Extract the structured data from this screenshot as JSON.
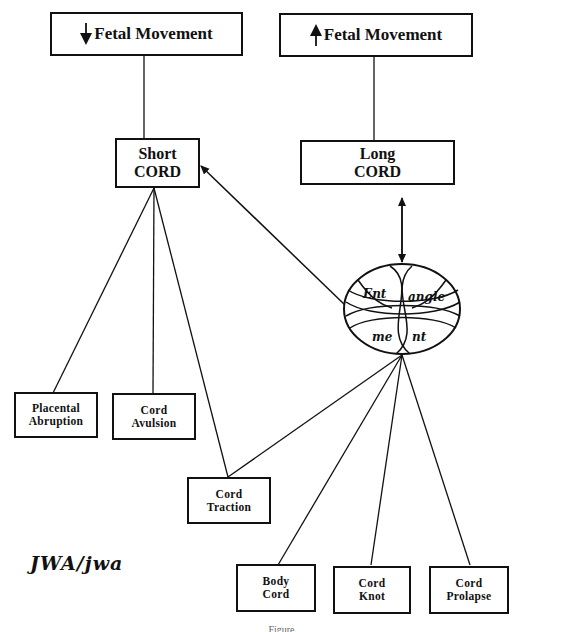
{
  "diagram": {
    "top_boxes": [
      {
        "arrow": "down",
        "label": "Fetal Movement"
      },
      {
        "arrow": "up",
        "label": "Fetal Movement"
      }
    ],
    "cord_boxes": {
      "short": {
        "line1": "Short",
        "line2": "CORD"
      },
      "long": {
        "line1": "Long",
        "line2": "CORD"
      }
    },
    "entanglement": {
      "segments": [
        "Ent",
        "angle",
        "me",
        "nt"
      ]
    },
    "outcomes": [
      {
        "line1": "Placental",
        "line2": "Abruption"
      },
      {
        "line1": "Cord",
        "line2": "Avulsion"
      },
      {
        "line1": "Cord",
        "line2": "Traction"
      },
      {
        "line1": "Body",
        "line2": "Cord"
      },
      {
        "line1": "Cord",
        "line2": "Knot"
      },
      {
        "line1": "Cord",
        "line2": "Prolapse"
      }
    ],
    "signature": "JWA/jwa",
    "caption": "Figure"
  }
}
